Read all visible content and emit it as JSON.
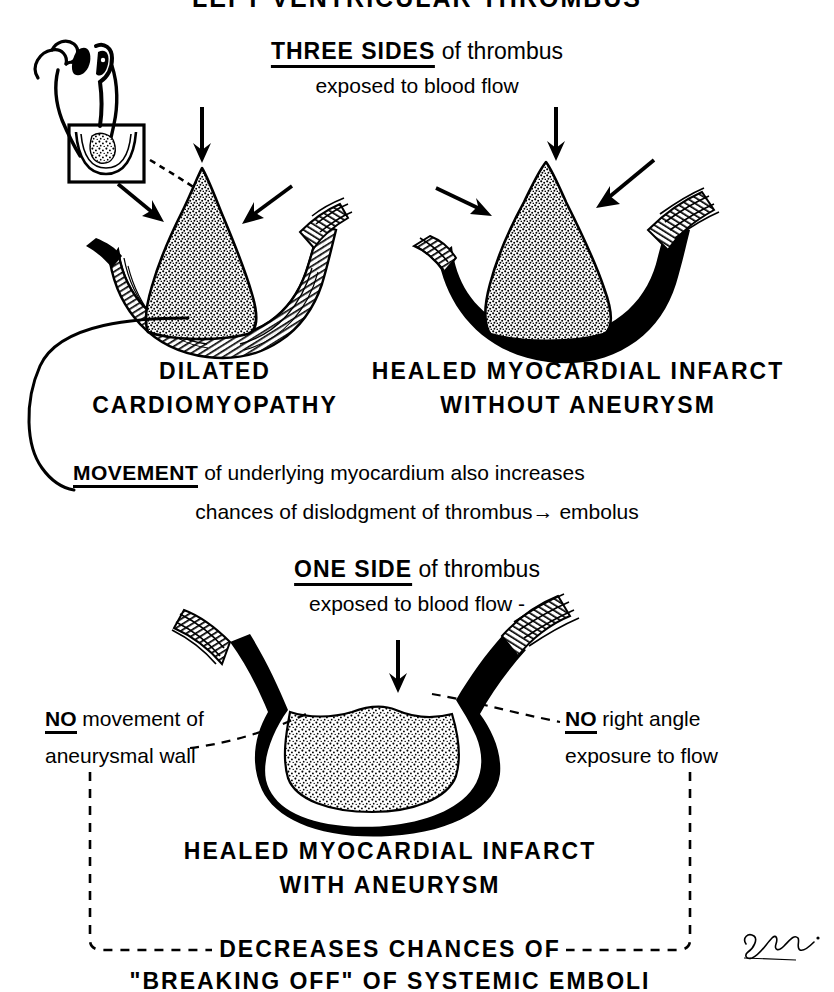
{
  "title": "LEFT VENTRICULAR THROMBUS",
  "top_section": {
    "heading_emphasis": "THREE SIDES",
    "heading_rest": " of thrombus",
    "subheading": "exposed to blood flow",
    "left_label_line1": "DILATED",
    "left_label_line2": "CARDIOMYOPATHY",
    "right_label_line1": "HEALED MYOCARDIAL INFARCT",
    "right_label_line2": "WITHOUT ANEURYSM"
  },
  "movement_note": {
    "emphasis": "MOVEMENT",
    "line1_rest": " of underlying myocardium also increases",
    "line2": "chances of dislodgment of thrombus→ embolus"
  },
  "bottom_section": {
    "heading_emphasis": "ONE SIDE",
    "heading_rest": " of thrombus",
    "subheading": "exposed to blood flow -",
    "left_note_emphasis": "NO",
    "left_note_rest": " movement of",
    "left_note_line2": "aneurysmal wall",
    "right_note_emphasis": "NO",
    "right_note_rest": " right angle",
    "right_note_line2": "exposure to flow",
    "label_line1": "HEALED MYOCARDIAL INFARCT",
    "label_line2": "WITH ANEURYSM",
    "conclusion_line1": "DECREASES CHANCES OF",
    "conclusion_line2": "\"BREAKING OFF\" OF SYSTEMIC EMBOLI"
  },
  "signature": "F. Schlumberger",
  "colors": {
    "ink": "#000000",
    "paper": "#ffffff"
  },
  "icons": {
    "down_arrow": "down-arrow",
    "diagonal_arrow": "diagonal-arrow",
    "inset_heart": "heart-outline-inset",
    "thrombus": "stippled-thrombus",
    "myocardium": "striated-myocardial-wall",
    "scar": "black-infarct-scar"
  }
}
